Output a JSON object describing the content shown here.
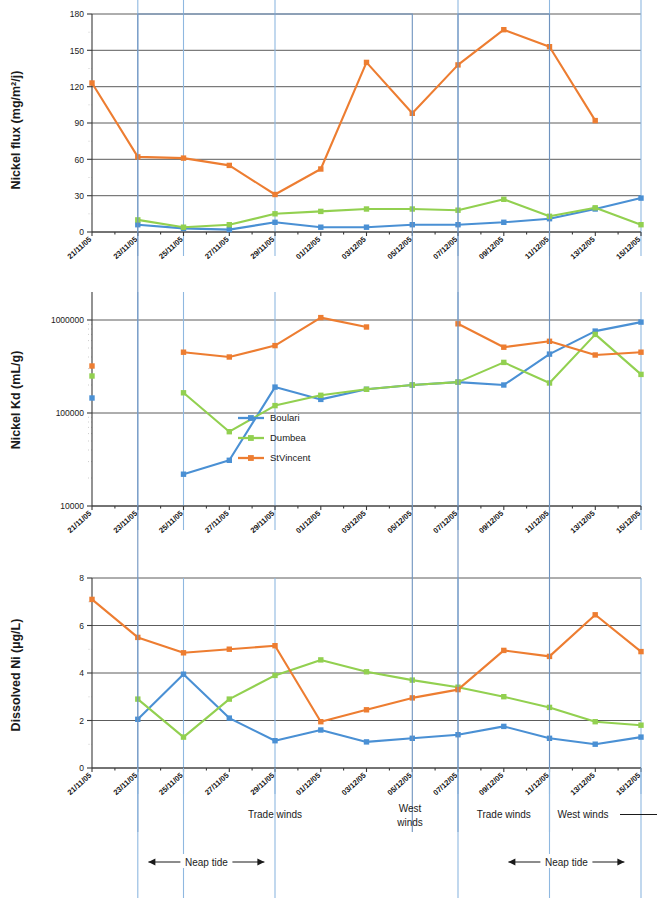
{
  "figure": {
    "x_categories": [
      "21/11/05",
      "23/11/05",
      "25/11/05",
      "27/11/05",
      "29/11/05",
      "01/12/05",
      "03/12/05",
      "05/12/05",
      "07/12/05",
      "09/12/05",
      "11/12/05",
      "13/12/05",
      "15/12/05"
    ],
    "series_names": [
      "Boulari",
      "Dumbea",
      "StVincent"
    ],
    "colors": {
      "boulari": "#4a90d4",
      "dumbea": "#92d050",
      "stvincent": "#ed7d31"
    }
  },
  "legend": {
    "items": [
      {
        "label": "Boulari",
        "color": "#4a90d4"
      },
      {
        "label": "Dumbea",
        "color": "#92d050"
      },
      {
        "label": "StVincent",
        "color": "#ed7d31"
      }
    ]
  },
  "annotations": {
    "trade_winds_1": "Trade winds",
    "west_winds_1": "West winds",
    "trade_winds_2": "Trade winds",
    "west_winds_2": "West winds",
    "neap_tide_1": "Neap tide",
    "neap_tide_2": "Neap tide",
    "arrow_left": "←",
    "arrow_right": "→"
  },
  "chart_data": [
    {
      "type": "line",
      "id": "nickel-flux",
      "title": "",
      "ylabel": "Nickel flux (mg/m²/j)",
      "xlabel": "",
      "yscale": "linear",
      "ylim": [
        0,
        180
      ],
      "yticks": [
        0,
        30,
        60,
        90,
        120,
        150,
        180
      ],
      "ytick_labels": [
        "0",
        "30",
        "60",
        "90",
        "120",
        "150",
        "180"
      ],
      "grid": true,
      "legend": "none",
      "categories": [
        "21/11/05",
        "23/11/05",
        "25/11/05",
        "27/11/05",
        "29/11/05",
        "01/12/05",
        "03/12/05",
        "05/12/05",
        "07/12/05",
        "09/12/05",
        "11/12/05",
        "13/12/05",
        "15/12/05"
      ],
      "series": [
        {
          "name": "Boulari",
          "color": "#4a90d4",
          "values": [
            null,
            6,
            3,
            2,
            8,
            4,
            4,
            6,
            6,
            8,
            11,
            19,
            28
          ]
        },
        {
          "name": "Dumbea",
          "color": "#92d050",
          "values": [
            null,
            10,
            4,
            6,
            15,
            17,
            19,
            19,
            18,
            27,
            13,
            20,
            6
          ]
        },
        {
          "name": "StVincent",
          "color": "#ed7d31",
          "values": [
            123,
            62,
            61,
            55,
            31,
            52,
            140,
            98,
            138,
            167,
            153,
            92,
            null
          ]
        }
      ]
    },
    {
      "type": "line",
      "id": "nickel-kd",
      "title": "",
      "ylabel": "Nickel Kd (mL/g)",
      "xlabel": "",
      "yscale": "log",
      "ylim": [
        10000,
        2000000
      ],
      "yticks": [
        10000,
        100000,
        1000000
      ],
      "ytick_labels": [
        "10000",
        "100000",
        "1000000"
      ],
      "grid": true,
      "legend": "center",
      "categories": [
        "21/11/05",
        "23/11/05",
        "25/11/05",
        "27/11/05",
        "29/11/05",
        "01/12/05",
        "03/12/05",
        "05/12/05",
        "07/12/05",
        "09/12/05",
        "11/12/05",
        "13/12/05",
        "15/12/05"
      ],
      "series": [
        {
          "name": "Boulari",
          "color": "#4a90d4",
          "values": [
            145000,
            null,
            22000,
            31000,
            190000,
            140000,
            180000,
            200000,
            215000,
            200000,
            430000,
            760000,
            950000
          ]
        },
        {
          "name": "Dumbea",
          "color": "#92d050",
          "values": [
            250000,
            null,
            165000,
            63000,
            120000,
            155000,
            180000,
            200000,
            215000,
            350000,
            210000,
            700000,
            260000
          ]
        },
        {
          "name": "StVincent",
          "color": "#ed7d31",
          "values": [
            320000,
            null,
            450000,
            400000,
            530000,
            1060000,
            840000,
            null,
            910000,
            510000,
            590000,
            420000,
            450000
          ]
        }
      ]
    },
    {
      "type": "line",
      "id": "dissolved-ni",
      "title": "",
      "ylabel": "Dissolved Ni (µg/L)",
      "xlabel": "",
      "yscale": "linear",
      "ylim": [
        0,
        8
      ],
      "yticks": [
        0,
        2,
        4,
        6,
        8
      ],
      "ytick_labels": [
        "0",
        "2",
        "4",
        "6",
        "8"
      ],
      "grid": true,
      "legend": "none",
      "categories": [
        "21/11/05",
        "23/11/05",
        "25/11/05",
        "27/11/05",
        "29/11/05",
        "01/12/05",
        "03/12/05",
        "05/12/05",
        "07/12/05",
        "09/12/05",
        "11/12/05",
        "13/12/05",
        "15/12/05"
      ],
      "series": [
        {
          "name": "Boulari",
          "color": "#4a90d4",
          "values": [
            null,
            2.05,
            3.95,
            2.1,
            1.15,
            1.6,
            1.1,
            1.25,
            1.4,
            1.75,
            1.25,
            1.0,
            1.3
          ]
        },
        {
          "name": "Dumbea",
          "color": "#92d050",
          "values": [
            null,
            2.9,
            1.3,
            2.9,
            3.9,
            4.55,
            4.05,
            3.7,
            3.4,
            3.0,
            2.55,
            1.95,
            1.8
          ]
        },
        {
          "name": "StVincent",
          "color": "#ed7d31",
          "values": [
            7.1,
            5.5,
            4.85,
            5.0,
            5.15,
            1.95,
            2.45,
            2.95,
            3.3,
            4.95,
            4.7,
            6.45,
            4.9
          ]
        }
      ]
    }
  ]
}
